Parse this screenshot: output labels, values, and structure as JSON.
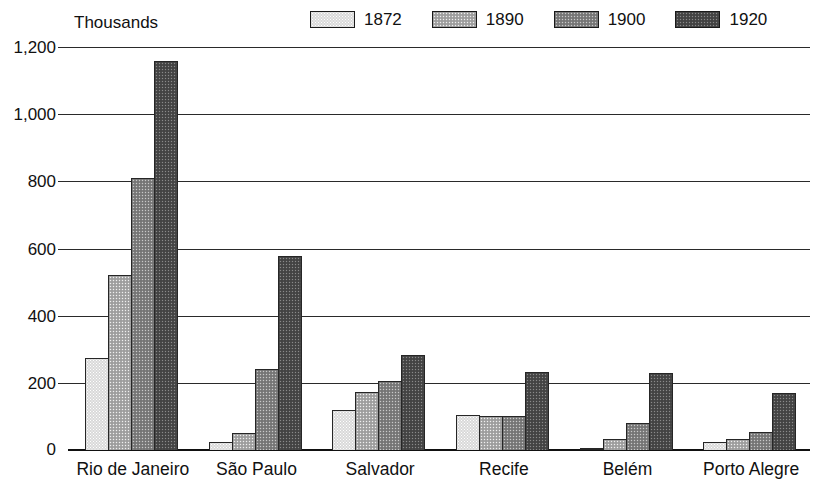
{
  "chart_data": {
    "type": "bar",
    "title": "",
    "axis_note": "Thousands",
    "xlabel": "",
    "ylabel": "Thousands",
    "ylim": [
      0,
      1200
    ],
    "yticks": [
      "0",
      "200",
      "400",
      "600",
      "800",
      "1,000",
      "1,200"
    ],
    "ytick_values": [
      0,
      200,
      400,
      600,
      800,
      1000,
      1200
    ],
    "grid": true,
    "legend_position": "top-right",
    "categories": [
      "Rio de Janeiro",
      "São Paulo",
      "Salvador",
      "Recife",
      "Belém",
      "Porto Alegre"
    ],
    "series": [
      {
        "name": "1872",
        "color": "#d9d9d9",
        "values": [
          275,
          25,
          120,
          105,
          6,
          24
        ]
      },
      {
        "name": "1890",
        "color": "#a8a8a8",
        "values": [
          522,
          52,
          174,
          100,
          33,
          32
        ]
      },
      {
        "name": "1900",
        "color": "#808080",
        "values": [
          810,
          240,
          205,
          102,
          80,
          55
        ]
      },
      {
        "name": "1920",
        "color": "#4a4a4a",
        "values": [
          1158,
          578,
          283,
          233,
          229,
          170
        ]
      }
    ]
  },
  "legend": {
    "entries": [
      {
        "label": "1872"
      },
      {
        "label": "1890"
      },
      {
        "label": "1900"
      },
      {
        "label": "1920"
      }
    ]
  },
  "axis": {
    "unit_label": "Thousands"
  }
}
